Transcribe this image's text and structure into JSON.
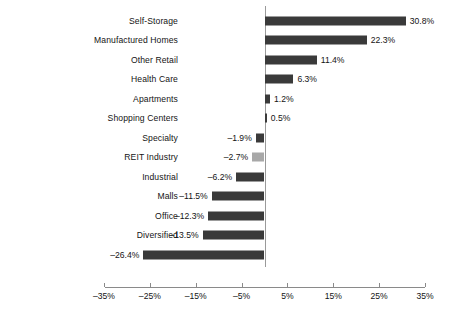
{
  "chart_data": {
    "type": "bar",
    "orientation": "horizontal",
    "title": "",
    "subtitle": "",
    "xlabel": "",
    "ylabel": "",
    "xlim": [
      -35,
      35
    ],
    "xticks": [
      -35,
      -25,
      -15,
      -5,
      5,
      15,
      25,
      35
    ],
    "xtick_labels": [
      "-35%",
      "-25%",
      "-15%",
      "-5%",
      "5%",
      "15%",
      "25%",
      "35%"
    ],
    "grid": false,
    "legend": "none",
    "zero_line": true,
    "categories": [
      "Self-Storage",
      "Manufactured Homes",
      "Other Retail",
      "Health Care",
      "Apartments",
      "Shopping Centers",
      "Specialty",
      "REIT Industry",
      "Industrial",
      "Malls",
      "Office",
      "Diversified",
      "Hotel"
    ],
    "values": [
      30.8,
      22.3,
      11.4,
      6.3,
      1.2,
      0.5,
      -1.9,
      -2.7,
      -6.2,
      -11.5,
      -12.3,
      -13.5,
      -26.4
    ],
    "data_labels": [
      "30.8%",
      "22.3%",
      "11.4%",
      "6.3%",
      "1.2%",
      "0.5%",
      "–1.9%",
      "–2.7%",
      "–6.2%",
      "–11.5%",
      "–12.3%",
      "–13.5%",
      "–26.4%"
    ],
    "highlight_category": "REIT Industry",
    "colors": {
      "bar": "#3a3a3a",
      "bar_highlight": "#a8a8a8",
      "axis": "#8a8a8a",
      "zero_line": "#9a9a9a",
      "text": "#141414",
      "background": "#ffffff"
    }
  },
  "caption": {
    "sliver_text": ""
  }
}
